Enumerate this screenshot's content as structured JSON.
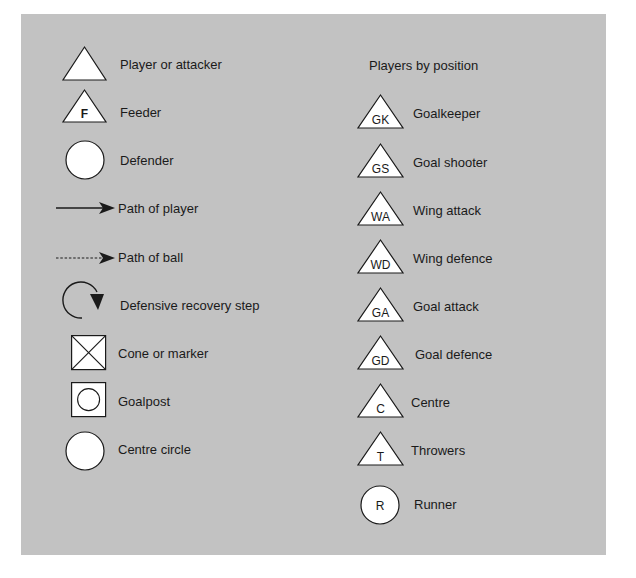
{
  "legend": {
    "left": [
      {
        "icon": "triangle",
        "label": "Player or attacker"
      },
      {
        "icon": "triangle-letter",
        "letter": "F",
        "label": "Feeder"
      },
      {
        "icon": "circle",
        "label": "Defender"
      },
      {
        "icon": "solid-arrow",
        "label": "Path of player"
      },
      {
        "icon": "dashed-arrow",
        "label": "Path of ball"
      },
      {
        "icon": "curved-arrow",
        "label": "Defensive recovery step"
      },
      {
        "icon": "crossed-square",
        "label": "Cone or marker"
      },
      {
        "icon": "square-circle",
        "label": "Goalpost"
      },
      {
        "icon": "circle",
        "label": "Centre circle"
      }
    ],
    "right_heading": "Players by position",
    "right": [
      {
        "icon": "triangle-letter",
        "letter": "GK",
        "label": "Goalkeeper"
      },
      {
        "icon": "triangle-letter",
        "letter": "GS",
        "label": "Goal shooter"
      },
      {
        "icon": "triangle-letter",
        "letter": "WA",
        "label": "Wing attack"
      },
      {
        "icon": "triangle-letter",
        "letter": "WD",
        "label": "Wing defence"
      },
      {
        "icon": "triangle-letter",
        "letter": "GA",
        "label": "Goal attack"
      },
      {
        "icon": "triangle-letter",
        "letter": "GD",
        "label": "Goal defence"
      },
      {
        "icon": "triangle-letter",
        "letter": "C",
        "label": "Centre"
      },
      {
        "icon": "triangle-letter",
        "letter": "T",
        "label": "Throwers"
      },
      {
        "icon": "circle-letter",
        "letter": "R",
        "label": "Runner"
      }
    ]
  },
  "colors": {
    "panel": "#c2c2c2",
    "shape_fill": "#ffffff",
    "stroke": "#1a1a1a"
  }
}
